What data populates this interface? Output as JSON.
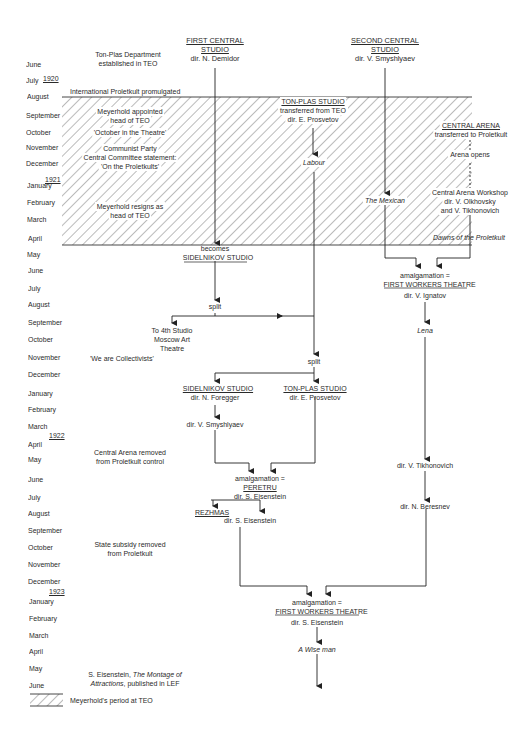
{
  "timeline": {
    "years": [
      {
        "label": "1920",
        "y": 78
      },
      {
        "label": "1921",
        "y": 178
      },
      {
        "label": "1922",
        "y": 437
      },
      {
        "label": "1923",
        "y": 591
      }
    ],
    "months": [
      {
        "label": "June",
        "y": 88
      },
      {
        "label": "July",
        "y": 104
      },
      {
        "label": "August",
        "y": 121
      },
      {
        "label": "September",
        "y": 139
      },
      {
        "label": "October",
        "y": 156
      },
      {
        "label": "November",
        "y": 171
      },
      {
        "label": "December",
        "y": 187
      },
      {
        "label": "January",
        "y": 204
      },
      {
        "label": "February",
        "y": 221
      },
      {
        "label": "March",
        "y": 238
      },
      {
        "label": "April",
        "y": 257
      },
      {
        "label": "May",
        "y": 275
      },
      {
        "label": "June",
        "y": 292
      },
      {
        "label": "July",
        "y": 310
      },
      {
        "label": "August",
        "y": 326
      },
      {
        "label": "September",
        "y": 344
      },
      {
        "label": "October",
        "y": 362
      },
      {
        "label": "November",
        "y": 380
      },
      {
        "label": "December",
        "y": 397
      },
      {
        "label": "January",
        "y": 413
      },
      {
        "label": "February",
        "y": 429
      },
      {
        "label": "March",
        "y": 446
      },
      {
        "label": "April",
        "y": 462
      },
      {
        "label": "May",
        "y": 478
      },
      {
        "label": "June",
        "y": 498
      },
      {
        "label": "July",
        "y": 515
      },
      {
        "label": "August",
        "y": 531
      },
      {
        "label": "September",
        "y": 548
      },
      {
        "label": "October",
        "y": 565
      },
      {
        "label": "November",
        "y": 582
      },
      {
        "label": "December",
        "y": 599
      },
      {
        "label": "January",
        "y": 616
      },
      {
        "label": "February",
        "y": 634
      },
      {
        "label": "March",
        "y": 650
      },
      {
        "label": "April",
        "y": 666
      },
      {
        "label": "May",
        "y": 683
      },
      {
        "label": "June",
        "y": 700
      }
    ]
  },
  "events": {
    "ton_plas_dept": [
      "Ton-Plas Department",
      "established in TEO"
    ],
    "intl_proletkult": "International Proletkult promulgated",
    "meyerhold_appointed": [
      "Meyerhold appointed",
      "head of TEO"
    ],
    "october_theatre": "'October in the Theatre'",
    "communist_party": [
      "Communist Party",
      "Central Committee statement:",
      "'On the Proletkults'"
    ],
    "meyerhold_resigns": [
      "Meyerhold resigns as",
      "head of TEO"
    ],
    "we_are_collectivists": "'We are Collectivists'",
    "central_arena_removed": [
      "Central Arena removed",
      "from Proletkult control"
    ],
    "state_subsidy": [
      "State subsidy removed",
      "from Proletkult"
    ],
    "montage": {
      "prefix": "S. Eisenstein, ",
      "title1": "The Montage of",
      "title2": "Attractions",
      "suffix": ", published in LEF"
    }
  },
  "nodes": {
    "first_central": {
      "title1": "FIRST CENTRAL",
      "title2": "STUDIO",
      "dir": "dir. N. Demidor"
    },
    "second_central": {
      "title1": "SECOND CENTRAL",
      "title2": "STUDIO",
      "dir": "dir. V. Smyshlyaev"
    },
    "ton_plas_1": {
      "title": "TON-PLAS STUDIO",
      "sub": "transferred from TEO",
      "dir": "dir. E. Prosvetov"
    },
    "labour": "Labour",
    "central_arena": {
      "title": "CENTRAL ARENA",
      "sub": "transferred to Proletkult",
      "opens": "Arena opens"
    },
    "the_mexican": "The Mexican",
    "arena_workshop": [
      "Central Arena Workshop",
      "dir. V. Olkhovsky",
      "and V. Tikhonovich"
    ],
    "dawns": "Dawns of the Proletkult",
    "becomes": "becomes",
    "sidelnikov_1": "SIDELNIKOV STUDIO",
    "amalg_fwt1": {
      "line1": "amalgamation =",
      "title": "FIRST WORKERS THEATRE",
      "dir": "dir. V. Ignatov"
    },
    "split_1": "split",
    "lena": "Lena",
    "fourth_studio": [
      "To 4th Studio",
      "Moscow Art",
      "Theatre"
    ],
    "split_2": "split",
    "sidelnikov_2": {
      "title": "SIDELNIKOV STUDIO",
      "dir": "dir. N. Foregger"
    },
    "ton_plas_2": {
      "title": "TON-PLAS STUDIO",
      "dir": "dir. E. Prosvetov"
    },
    "smyshlyaev": "dir. V. Smyshlyaev",
    "tikhonovich": "dir. V. Tikhonovich",
    "peretru": {
      "line1": "amalgamation =",
      "title": "PERETRU",
      "dir": "dir. S. Eisenstein"
    },
    "beresnev": "dir. N. Beresnev",
    "rezhmas": {
      "title": "REZHMAS",
      "dir": "dir. S. Eisenstein"
    },
    "amalg_fwt2": {
      "line1": "amalgamation =",
      "title": "FIRST WORKERS THEATRE",
      "dir": "dir. S. Eisenstein"
    },
    "wise_man": "A Wise man"
  },
  "legend": {
    "label": "Meyerhold's period at TEO"
  }
}
